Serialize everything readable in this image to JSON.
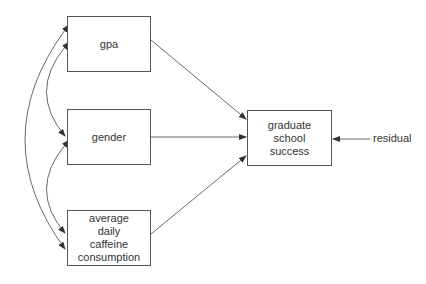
{
  "diagram": {
    "type": "path-diagram",
    "nodes": {
      "gpa": {
        "lines": [
          "gpa"
        ]
      },
      "gender": {
        "lines": [
          "gender"
        ]
      },
      "caffeine": {
        "lines": [
          "average",
          "daily",
          "caffeine",
          "consumption"
        ]
      },
      "outcome": {
        "lines": [
          "graduate",
          "school",
          "success"
        ]
      }
    },
    "residual_label": "residual",
    "edges": [
      {
        "from": "gpa",
        "to": "outcome",
        "type": "directed"
      },
      {
        "from": "gender",
        "to": "outcome",
        "type": "directed"
      },
      {
        "from": "caffeine",
        "to": "outcome",
        "type": "directed"
      },
      {
        "from": "residual",
        "to": "outcome",
        "type": "directed"
      },
      {
        "from": "gpa",
        "to": "gender",
        "type": "covariance"
      },
      {
        "from": "gender",
        "to": "caffeine",
        "type": "covariance"
      },
      {
        "from": "gpa",
        "to": "caffeine",
        "type": "covariance"
      }
    ]
  }
}
